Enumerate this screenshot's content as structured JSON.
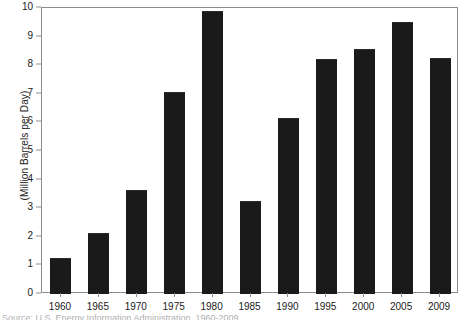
{
  "chart_data": {
    "type": "bar",
    "title": "",
    "subtitle": "",
    "xlabel": "",
    "ylabel": "(Million Barrels per Day)",
    "categories": [
      "1960",
      "1965",
      "1970",
      "1975",
      "1980",
      "1985",
      "1990",
      "1995",
      "2000",
      "2005",
      "2009"
    ],
    "values": [
      1.25,
      2.15,
      3.65,
      7.05,
      9.9,
      3.25,
      6.15,
      8.2,
      8.55,
      9.5,
      8.25
    ],
    "ylim": [
      0,
      10
    ],
    "ytick_values": [
      0,
      1,
      2,
      3,
      4,
      5,
      6,
      7,
      8,
      9,
      10
    ],
    "ytick_labels": [
      "0",
      "1",
      "2",
      "3",
      "4",
      "5",
      "6",
      "7",
      "8",
      "9",
      "10"
    ],
    "grid": false,
    "legend": null,
    "legend_position": "none",
    "bar_color": "#1a1a1a",
    "frame_color": "#8d8d8d",
    "background_color": "#ffffff",
    "annotations": []
  },
  "caption": {
    "text": "Source: U.S. Energy Information Administration, 1960-2009"
  }
}
